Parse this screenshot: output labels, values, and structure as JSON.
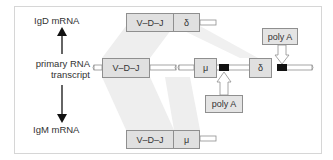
{
  "labels": {
    "igd": "IgD mRNA",
    "primary_line1": "primary RNA",
    "primary_line2": "transcript",
    "igm": "IgM mRNA"
  },
  "igd_mrna": {
    "segments": [
      "V–D–J",
      "δ"
    ]
  },
  "primary_transcript": {
    "segments": [
      "V–D–J",
      "μ",
      "δ"
    ],
    "polyA_sites": 2
  },
  "igm_mrna": {
    "segments": [
      "V–D–J",
      "μ"
    ]
  },
  "polyA": {
    "upper": "poly A",
    "lower": "poly A"
  },
  "colors": {
    "box_fill": "#e0e0e0",
    "box_border": "#8f8f8f",
    "splice_band": "#eeeeee",
    "polyA_marker": "#111111",
    "frame_border": "#d6d6d6"
  }
}
